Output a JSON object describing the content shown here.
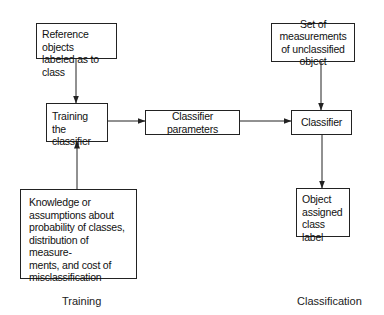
{
  "diagram": {
    "type": "flowchart",
    "nodes": {
      "reference_objects": {
        "label": "Reference objects\nlabeled as to class"
      },
      "training_classifier": {
        "label": "Training the\nclassifier"
      },
      "classifier_parameters": {
        "label": "Classifier parameters"
      },
      "measurements": {
        "label": "Set of measurements\nof unclassified object"
      },
      "classifier": {
        "label": "Classifier"
      },
      "knowledge": {
        "label": "Knowledge or\nassumptions about\nprobability of classes,\ndistribution of measure-\nments, and cost of\nmisclassification"
      },
      "object_assigned": {
        "label": "Object\nassigned\nclass label"
      }
    },
    "edges": [
      {
        "from": "reference_objects",
        "to": "training_classifier"
      },
      {
        "from": "knowledge",
        "to": "training_classifier"
      },
      {
        "from": "training_classifier",
        "to": "classifier_parameters"
      },
      {
        "from": "classifier_parameters",
        "to": "classifier"
      },
      {
        "from": "measurements",
        "to": "classifier"
      },
      {
        "from": "classifier",
        "to": "object_assigned"
      }
    ],
    "sections": {
      "training": "Training",
      "classification": "Classification"
    },
    "colors": {
      "stroke": "#222222",
      "background": "#ffffff",
      "text": "#111111"
    }
  }
}
